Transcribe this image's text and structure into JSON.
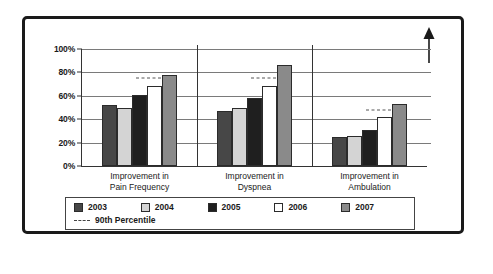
{
  "chart_data": {
    "type": "bar",
    "title": "",
    "subtitle": "",
    "xlabel": "",
    "ylabel": "",
    "ylim": [
      0,
      100
    ],
    "ytick_values": [
      0,
      20,
      40,
      60,
      80,
      100
    ],
    "ytick_labels": [
      "0%",
      "20%",
      "40%",
      "60%",
      "80%",
      "100%"
    ],
    "grid": true,
    "legend_position": "bottom",
    "categories": [
      "Improvement in\nPain Frequency",
      "Improvement in\nDyspnea",
      "Improvement in\nAmbulation"
    ],
    "series": [
      {
        "name": "2003",
        "color": "#474747",
        "values": [
          52,
          47,
          25
        ]
      },
      {
        "name": "2004",
        "color": "#d4d4d4",
        "values": [
          50,
          50,
          26
        ]
      },
      {
        "name": "2005",
        "color": "#1f1f1f",
        "values": [
          61,
          58,
          31
        ]
      },
      {
        "name": "2006",
        "color": "#ffffff",
        "values": [
          68,
          68,
          42
        ]
      },
      {
        "name": "2007",
        "color": "#8a8a8a",
        "values": [
          78,
          86,
          53
        ]
      }
    ],
    "reference_line": {
      "name": "90th Percentile",
      "style": "dashed",
      "color": "#555555",
      "values": [
        75,
        75,
        48
      ]
    },
    "annotations": [
      {
        "name": "up-arrow",
        "label": "",
        "position": "top-right"
      }
    ]
  },
  "legend": {
    "items": [
      {
        "label": "2003",
        "color": "#474747"
      },
      {
        "label": "2004",
        "color": "#d4d4d4"
      },
      {
        "label": "2005",
        "color": "#1f1f1f"
      },
      {
        "label": "2006",
        "color": "#ffffff"
      },
      {
        "label": "2007",
        "color": "#8a8a8a"
      }
    ],
    "reference_label": "90th Percentile"
  }
}
